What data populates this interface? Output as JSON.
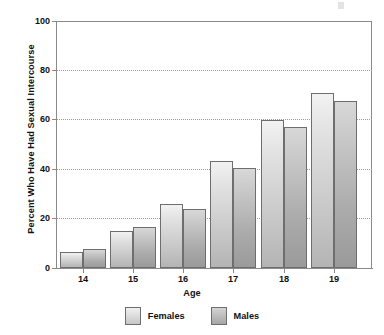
{
  "chart_data": {
    "type": "bar",
    "title": "",
    "xlabel": "Age",
    "ylabel": "Percent Who Have Had Sexual Intercourse",
    "categories": [
      "14",
      "15",
      "16",
      "17",
      "18",
      "19"
    ],
    "series": [
      {
        "name": "Females",
        "values": [
          6.5,
          15,
          26,
          43.5,
          60,
          71
        ]
      },
      {
        "name": "Males",
        "values": [
          7.5,
          16.5,
          24,
          40.5,
          57,
          67.5
        ]
      }
    ],
    "ylim": [
      0,
      100
    ],
    "y_ticks": [
      "0",
      "20",
      "40",
      "60",
      "80",
      "100"
    ],
    "grid": true,
    "legend_position": "bottom",
    "colors": {
      "females": "#dcdcdc",
      "males": "#b4b4b4",
      "bar_border": "#6e6e6e",
      "axis": "#8a8a8a",
      "gridline": "#9a9a9a",
      "text": "#111111",
      "background": "#ffffff"
    }
  },
  "legend": {
    "items": [
      {
        "label": "Females"
      },
      {
        "label": "Males"
      }
    ]
  }
}
